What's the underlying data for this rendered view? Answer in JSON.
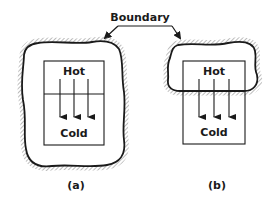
{
  "diagram": {
    "boundary_label": "Boundary",
    "colors": {
      "ink": "#1a1a1a",
      "hatch": "#7a7a7a",
      "background": "#ffffff"
    },
    "panels": [
      {
        "caption": "(a)",
        "top_label": "Hot",
        "bottom_label": "Cold",
        "boundary_encloses": "entire system",
        "arrows": 3,
        "arrow_direction": "down"
      },
      {
        "caption": "(b)",
        "top_label": "Hot",
        "bottom_label": "Cold",
        "boundary_encloses": "hot region only",
        "arrows": 3,
        "arrow_direction": "down"
      }
    ]
  }
}
